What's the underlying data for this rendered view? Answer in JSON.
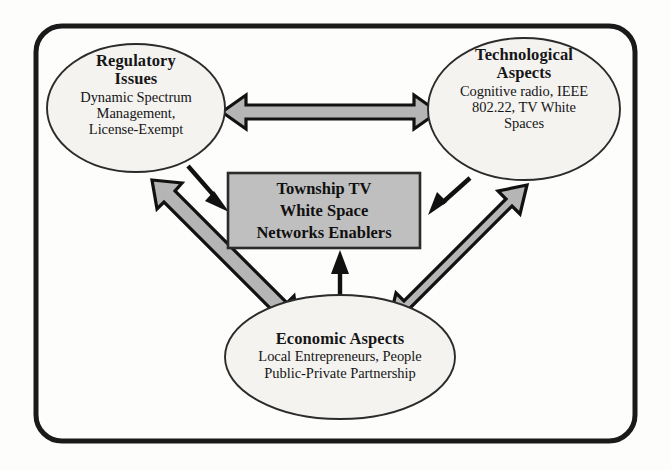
{
  "diagram": {
    "background_color": "#fdfdfb",
    "frame": {
      "name": "outer-frame",
      "stroke_color": "#1a1a1a",
      "fill_color": "none"
    },
    "center_box": {
      "line1": "Township TV",
      "line2": "White Space",
      "line3": "Networks Enablers",
      "fill_color": "#bfbfbf",
      "stroke_color": "#2b2b2b"
    },
    "nodes": [
      {
        "id": "regulatory",
        "title_line1": "Regulatory",
        "title_line2": "Issues",
        "sub_line1": "Dynamic Spectrum",
        "sub_line2": "Management,",
        "sub_line3": "License-Exempt",
        "fill_color": "#f4f3f0",
        "stroke_color": "#2b2b2b"
      },
      {
        "id": "technological",
        "title_line1": "Technological",
        "title_line2": "Aspects",
        "sub_line1": "Cognitive radio, IEEE",
        "sub_line2": "802.22, TV White",
        "sub_line3": "Spaces",
        "fill_color": "#f4f3f0",
        "stroke_color": "#2b2b2b"
      },
      {
        "id": "economic",
        "title_line1": "Economic Aspects",
        "title_line2": "",
        "sub_line1": "Local Entrepreneurs, People",
        "sub_line2": "Public-Private Partnership",
        "sub_line3": "",
        "fill_color": "#f4f3f0",
        "stroke_color": "#2b2b2b"
      }
    ],
    "connectors": [
      {
        "id": "regulatory-technological",
        "style": "double-headed-block-arrow",
        "fill_color": "#b5b5b5",
        "stroke_color": "#111111"
      },
      {
        "id": "regulatory-economic",
        "style": "double-headed-block-arrow",
        "fill_color": "#b5b5b5",
        "stroke_color": "#111111"
      },
      {
        "id": "technological-economic",
        "style": "double-headed-block-arrow",
        "fill_color": "#b5b5b5",
        "stroke_color": "#111111"
      },
      {
        "id": "regulatory-to-center",
        "style": "single-thin-arrow",
        "fill_color": "#111111",
        "stroke_color": "#111111"
      },
      {
        "id": "technological-to-center",
        "style": "single-thin-arrow",
        "fill_color": "#111111",
        "stroke_color": "#111111"
      },
      {
        "id": "economic-to-center",
        "style": "single-thin-arrow",
        "fill_color": "#111111",
        "stroke_color": "#111111"
      }
    ]
  }
}
